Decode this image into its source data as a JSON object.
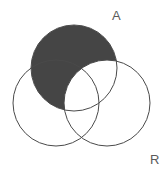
{
  "figure": {
    "kind": "venn-diagram",
    "width": 164,
    "height": 176,
    "background_color": "#ffffff",
    "outline_color": "#4a4a4a",
    "shade_color": "#454545",
    "shaded_description": "top circle excluding the right circle"
  },
  "labels": {
    "top_right": "A",
    "bottom_right": "R"
  },
  "sets": [
    {
      "id": "top",
      "label": "A",
      "center_x": 74,
      "center_y": 68,
      "radius": 43,
      "shaded": true
    },
    {
      "id": "left",
      "label": "",
      "center_x": 56,
      "center_y": 103,
      "radius": 43,
      "shaded": false
    },
    {
      "id": "right",
      "label": "R",
      "center_x": 107,
      "center_y": 103,
      "radius": 43,
      "shaded": false
    }
  ]
}
